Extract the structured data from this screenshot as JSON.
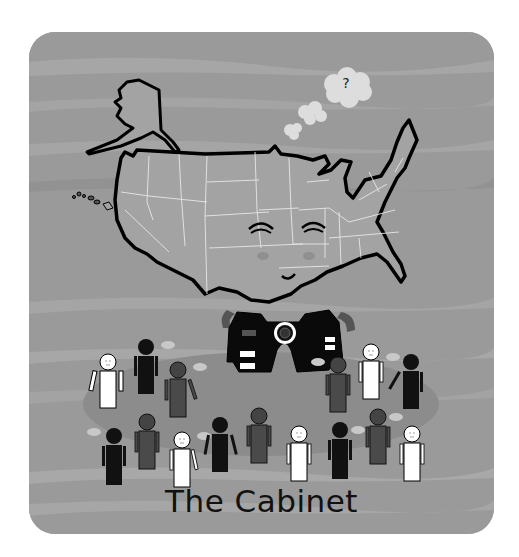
{
  "illustration": {
    "title": "The Cabinet",
    "thought_bubble_text": "?",
    "subject": "cartoon map of the United States with a smiling face wearing a dark suit with presidential seal, surrounded by cabinet member stick figures",
    "colors": {
      "background": "#ffffff",
      "card": "#9a9a9a",
      "stripe_light": "#a8a8a8",
      "stripe_dark": "#909090",
      "map_fill": "#a3a3a3",
      "map_outline": "#000000",
      "state_lines": "#e8e8e8",
      "suit": "#0a0a0a",
      "shadow_ellipse": "#8a8a8a",
      "figure_black": "#111111",
      "figure_dark_gray": "#4a4a4a",
      "figure_white": "#ffffff",
      "speech_bubble": "#c8c8c8"
    },
    "figures": {
      "top_row_count": 7,
      "bottom_row_count": 10
    }
  }
}
